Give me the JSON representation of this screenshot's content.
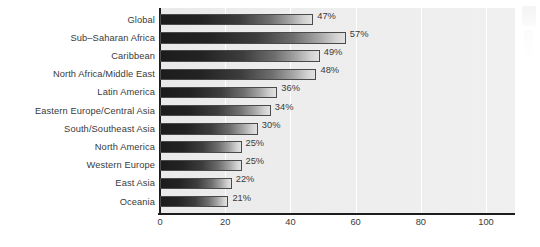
{
  "chart_data": {
    "type": "bar",
    "orientation": "horizontal",
    "title": "",
    "subtitle": "",
    "xlabel": "",
    "ylabel": "",
    "xlim": [
      0,
      110
    ],
    "axis_max_tick": 100,
    "grid": true,
    "gridlines_at": [
      20,
      40,
      60,
      80,
      100
    ],
    "legend": "none",
    "xticks": [
      "0",
      "20",
      "40",
      "60",
      "80",
      "100"
    ],
    "xtick_values": [
      0,
      20,
      40,
      60,
      80,
      100
    ],
    "categories": [
      "Global",
      "Sub–Saharan Africa",
      "Caribbean",
      "North Africa/Middle East",
      "Latin America",
      "Eastern Europe/Central Asia",
      "South/Southeast Asia",
      "North America",
      "Western Europe",
      "East Asia",
      "Oceania"
    ],
    "values": [
      47,
      57,
      49,
      48,
      36,
      34,
      30,
      25,
      25,
      22,
      21
    ],
    "value_labels": [
      "47%",
      "57%",
      "49%",
      "48%",
      "36%",
      "34%",
      "30%",
      "25%",
      "25%",
      "22%",
      "21%"
    ],
    "colors": {
      "bar_gradient_start": "#1c1c1c",
      "bar_gradient_end": "#e2e2e2",
      "bar_border": "#4a4a4a",
      "plot_background": "#ededed",
      "gridline": "#ffffff",
      "axis_line": "#1d1d1d",
      "text": "#3a3a3a",
      "page_background": "#ffffff"
    }
  }
}
